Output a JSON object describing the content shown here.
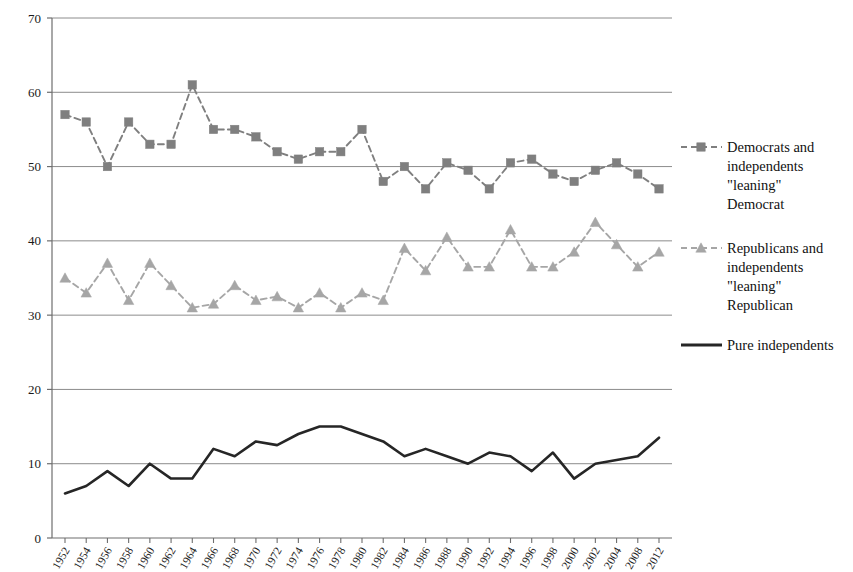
{
  "chart_data": {
    "type": "line",
    "title": "",
    "subtitle": "",
    "xlabel": "",
    "ylabel": "",
    "xlim": [
      1952,
      2012
    ],
    "ylim": [
      0,
      70
    ],
    "yticks": [
      0,
      10,
      20,
      30,
      40,
      50,
      60,
      70
    ],
    "grid": true,
    "legend_position": "right",
    "categories": [
      "1952",
      "1954",
      "1956",
      "1958",
      "1960",
      "1962",
      "1964",
      "1966",
      "1968",
      "1970",
      "1972",
      "1974",
      "1976",
      "1978",
      "1980",
      "1982",
      "1984",
      "1986",
      "1988",
      "1990",
      "1992",
      "1994",
      "1996",
      "1998",
      "2000",
      "2002",
      "2004",
      "2008",
      "2012"
    ],
    "series": [
      {
        "name": "Democrats and independents \"leaning\" Democrat",
        "marker": "square",
        "line_style": "dashed",
        "color": "#7f7f7f",
        "values": [
          57,
          56,
          50,
          56,
          53,
          53,
          61,
          55,
          55,
          54,
          52,
          51,
          52,
          52,
          55,
          48,
          50,
          47,
          50.5,
          49.5,
          47,
          50.5,
          51,
          49,
          48,
          49.5,
          50.5,
          49,
          47
        ]
      },
      {
        "name": "Republicans and independents \"leaning\" Republican",
        "marker": "triangle",
        "line_style": "dashed",
        "color": "#a6a6a6",
        "values": [
          35,
          33,
          37,
          32,
          37,
          34,
          31,
          31.5,
          34,
          32,
          32.5,
          31,
          33,
          31,
          33,
          32,
          39,
          36,
          40.5,
          36.5,
          36.5,
          41.5,
          36.5,
          36.5,
          38.5,
          42.5,
          39.5,
          36.5,
          38.5
        ]
      },
      {
        "name": "Pure independents",
        "marker": "none",
        "line_style": "solid",
        "color": "#262626",
        "values": [
          6,
          7,
          9,
          7,
          10,
          8,
          8,
          12,
          11,
          13,
          12.5,
          14,
          15,
          15,
          14,
          13,
          11,
          12,
          11,
          10,
          11.5,
          11,
          9,
          11.5,
          8,
          10,
          10.5,
          11,
          13.5
        ]
      }
    ]
  },
  "legend": {
    "entries": [
      {
        "id": "democrats",
        "lines": [
          "Democrats and",
          "independents",
          "\"leaning\"",
          "Democrat"
        ],
        "swatch": "dashed-square-marker"
      },
      {
        "id": "republicans",
        "lines": [
          "Republicans and",
          "independents",
          "\"leaning\"",
          "Republican"
        ],
        "swatch": "dashed-triangle-marker"
      },
      {
        "id": "pure-independents",
        "lines": [
          "Pure independents"
        ],
        "swatch": "solid-line"
      }
    ]
  },
  "colors": {
    "democrat_series": "#7f7f7f",
    "republican_series": "#a6a6a6",
    "independent_series": "#262626",
    "gridline": "#8c8c8c",
    "axis": "#6e6e6e",
    "background": "#ffffff"
  }
}
